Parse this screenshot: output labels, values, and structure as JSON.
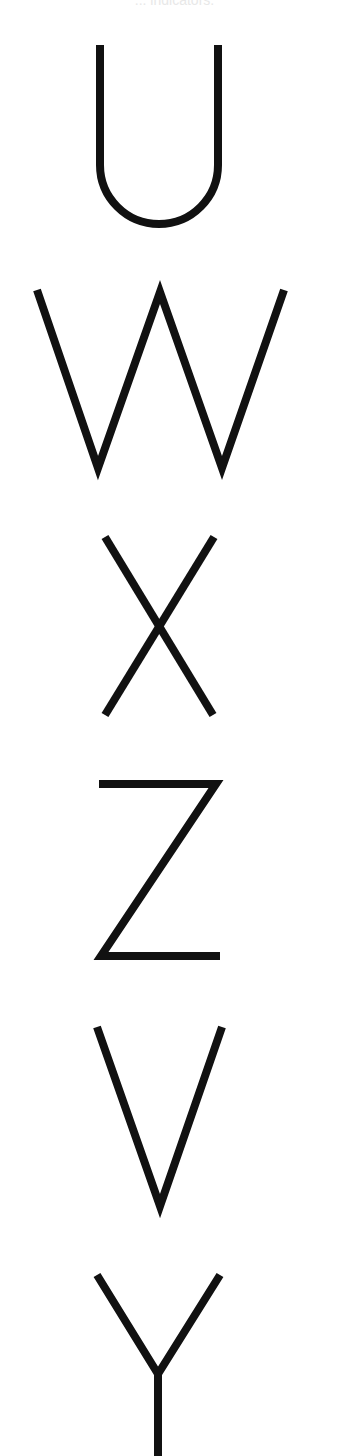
{
  "caption": "... indicators.",
  "letters": [
    {
      "char": "U",
      "top": 45,
      "bottom": 225
    },
    {
      "char": "W",
      "top": 290,
      "bottom": 470
    },
    {
      "char": "X",
      "top": 537,
      "bottom": 715
    },
    {
      "char": "Z",
      "top": 780,
      "bottom": 960
    },
    {
      "char": "V",
      "top": 1027,
      "bottom": 1208
    },
    {
      "char": "Y",
      "top": 1275,
      "bottom": 1456
    }
  ],
  "colors": {
    "stroke": "#111111",
    "background": "#ffffff"
  },
  "letter_sequence": "UWXZVY"
}
